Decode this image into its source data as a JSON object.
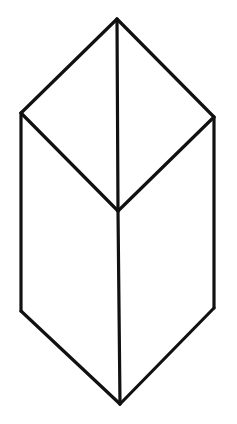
{
  "figure": {
    "stroke_color": "#111111",
    "background_color": "#ffffff",
    "vertices": {
      "top": "T",
      "left_upper": "L",
      "right_upper": "R",
      "center": "C",
      "left_lower": "LL",
      "right_lower": "RL",
      "bottom": "B"
    },
    "edges": [
      {
        "name": "edge-top-left",
        "from": "T",
        "to": "L"
      },
      {
        "name": "edge-top-right",
        "from": "T",
        "to": "R"
      },
      {
        "name": "edge-left-center",
        "from": "L",
        "to": "C"
      },
      {
        "name": "edge-right-center",
        "from": "R",
        "to": "C"
      },
      {
        "name": "edge-top-center-vertical",
        "from": "T",
        "to": "C"
      },
      {
        "name": "edge-center-bottom-vertical",
        "from": "C",
        "to": "B"
      },
      {
        "name": "edge-left-vertical",
        "from": "L",
        "to": "LL"
      },
      {
        "name": "edge-right-vertical",
        "from": "R",
        "to": "RL"
      },
      {
        "name": "edge-lower-left-bottom",
        "from": "LL",
        "to": "B"
      },
      {
        "name": "edge-lower-right-bottom",
        "from": "RL",
        "to": "B"
      }
    ]
  }
}
